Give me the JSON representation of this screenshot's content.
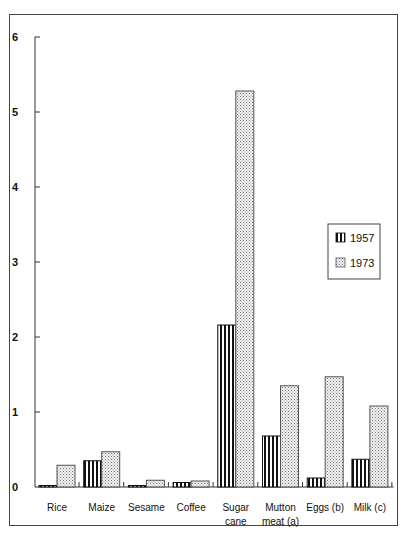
{
  "chart_data": {
    "type": "bar",
    "title": "",
    "xlabel": "",
    "ylabel": "",
    "ylim": [
      0,
      6
    ],
    "yticks": [
      0,
      1,
      2,
      3,
      4,
      5,
      6
    ],
    "grid": false,
    "legend_position": "right, middle",
    "categories": [
      "Rice",
      "Maize",
      "Sesame",
      "Coffee",
      "Sugar cane",
      "Mutton meat (a)",
      "Eggs (b)",
      "Milk (c)"
    ],
    "category_lines": [
      [
        "Rice"
      ],
      [
        "Maize"
      ],
      [
        "Sesame"
      ],
      [
        "Coffee"
      ],
      [
        "Sugar",
        "cane"
      ],
      [
        "Mutton",
        "meat (a)"
      ],
      [
        "Eggs (b)"
      ],
      [
        "Milk (c)"
      ]
    ],
    "series": [
      {
        "name": "1957",
        "pattern": "vertical-stripes",
        "values": [
          0.02,
          0.35,
          0.02,
          0.06,
          2.16,
          0.68,
          0.12,
          0.37
        ]
      },
      {
        "name": "1973",
        "pattern": "dotted",
        "values": [
          0.29,
          0.47,
          0.09,
          0.08,
          5.28,
          1.35,
          1.47,
          1.08
        ]
      }
    ]
  },
  "legend": {
    "items": [
      {
        "label": "1957"
      },
      {
        "label": "1973"
      }
    ]
  },
  "colors": {
    "axis": "#333333",
    "stripe": "#111111",
    "dot": "#777777",
    "frame": "#444444"
  }
}
